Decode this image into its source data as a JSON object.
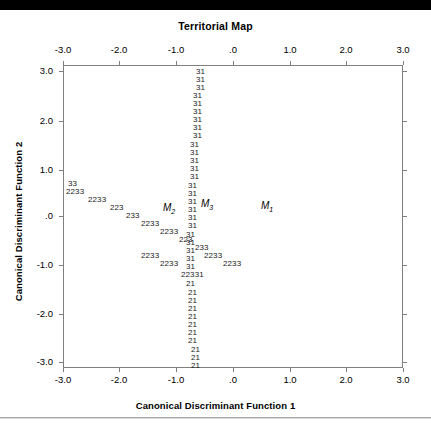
{
  "chart_data": {
    "type": "scatter",
    "title": "Territorial Map",
    "subtitle": "Canonical Discriminant Functions",
    "xlabel": "Canonical Discriminant Function 1",
    "ylabel": "Canonical Discriminant Function 2",
    "xlim": [
      -3.5,
      3.5
    ],
    "ylim": [
      -3.5,
      3.5
    ],
    "xticks": [
      "-3.0",
      "-2.0",
      "-1.0",
      ".0",
      "1.0",
      "2.0",
      "3.0"
    ],
    "xtick_values": [
      -3.0,
      -2.0,
      -1.0,
      0.0,
      1.0,
      2.0,
      3.0
    ],
    "yticks": [
      "3.0",
      "2.0",
      "1.0",
      ".0",
      "-1.0",
      "-2.0",
      "-3.0"
    ],
    "ytick_values": [
      3.0,
      2.0,
      1.0,
      0.0,
      -1.0,
      -2.0,
      -3.0
    ],
    "grid": false,
    "legend": "none",
    "series": [
      {
        "name": "boundary-3-1",
        "symbol": "31",
        "description": "Vertical territorial boundary separating group 3 and group 1",
        "points": [
          {
            "x": -0.6,
            "y": 3.22
          },
          {
            "x": -0.6,
            "y": 3.05
          },
          {
            "x": -0.6,
            "y": 2.88
          },
          {
            "x": -0.63,
            "y": 2.71
          },
          {
            "x": -0.63,
            "y": 2.54
          },
          {
            "x": -0.63,
            "y": 2.37
          },
          {
            "x": -0.63,
            "y": 2.2
          },
          {
            "x": -0.63,
            "y": 2.03
          },
          {
            "x": -0.63,
            "y": 1.86
          },
          {
            "x": -0.66,
            "y": 1.69
          },
          {
            "x": -0.66,
            "y": 1.52
          },
          {
            "x": -0.66,
            "y": 1.35
          },
          {
            "x": -0.66,
            "y": 1.18
          },
          {
            "x": -0.66,
            "y": 1.01
          },
          {
            "x": -0.7,
            "y": 0.84
          },
          {
            "x": -0.7,
            "y": 0.67
          },
          {
            "x": -0.7,
            "y": 0.5
          },
          {
            "x": -0.7,
            "y": 0.33
          },
          {
            "x": -0.7,
            "y": 0.16
          },
          {
            "x": -0.7,
            "y": -0.01
          },
          {
            "x": -0.73,
            "y": -0.18
          },
          {
            "x": -0.73,
            "y": -0.35
          },
          {
            "x": -0.73,
            "y": -0.52
          },
          {
            "x": -0.73,
            "y": -0.69
          },
          {
            "x": -0.73,
            "y": -0.86
          },
          {
            "x": -0.73,
            "y": -1.03
          }
        ]
      },
      {
        "name": "boundary-2-3",
        "symbol": "2233",
        "description": "Diagonal territorial boundary separating group 2 and group 3",
        "points": [
          {
            "x": -3.02,
            "y": 0.5
          },
          {
            "x": -2.94,
            "y": 0.33
          },
          {
            "x": -2.72,
            "y": 0.16
          },
          {
            "x": -2.5,
            "y": -0.01
          },
          {
            "x": -2.34,
            "y": -0.18
          },
          {
            "x": -2.18,
            "y": -0.35
          },
          {
            "x": -1.99,
            "y": -0.52
          },
          {
            "x": -1.8,
            "y": -0.69
          },
          {
            "x": -1.64,
            "y": -0.86
          },
          {
            "x": -1.45,
            "y": -1.03
          },
          {
            "x": -1.26,
            "y": -1.2
          }
        ]
      },
      {
        "name": "boundary-2-1",
        "symbol": "21",
        "description": "Vertical territorial boundary separating group 2 and group 1",
        "points": [
          {
            "x": -0.79,
            "y": -1.45
          },
          {
            "x": -0.79,
            "y": -1.62
          },
          {
            "x": -0.79,
            "y": -1.79
          },
          {
            "x": -0.79,
            "y": -1.96
          },
          {
            "x": -0.79,
            "y": -2.13
          },
          {
            "x": -0.79,
            "y": -2.3
          },
          {
            "x": -0.79,
            "y": -2.47
          },
          {
            "x": -0.79,
            "y": -2.64
          },
          {
            "x": -0.73,
            "y": -2.81
          },
          {
            "x": -0.73,
            "y": -2.98
          },
          {
            "x": -0.73,
            "y": -3.15
          }
        ]
      }
    ],
    "centroids": [
      {
        "label": "M",
        "subscript": "2",
        "group": 2,
        "x": -1.02,
        "y": 0.02
      },
      {
        "label": "M",
        "subscript": "3",
        "group": 3,
        "x": -0.32,
        "y": 0.14
      },
      {
        "label": "M",
        "subscript": "1",
        "group": 1,
        "x": 0.86,
        "y": 0.04
      }
    ],
    "symbol_rows": [
      {
        "text": "31",
        "x": 196,
        "y": 68
      },
      {
        "text": "31",
        "x": 196,
        "y": 76
      },
      {
        "text": "31",
        "x": 196,
        "y": 84
      },
      {
        "text": "31",
        "x": 193,
        "y": 92
      },
      {
        "text": "31",
        "x": 193,
        "y": 100
      },
      {
        "text": "31",
        "x": 193,
        "y": 108
      },
      {
        "text": "31",
        "x": 193,
        "y": 116
      },
      {
        "text": "31",
        "x": 193,
        "y": 124
      },
      {
        "text": "31",
        "x": 193,
        "y": 132
      },
      {
        "text": "31",
        "x": 190,
        "y": 141
      },
      {
        "text": "31",
        "x": 190,
        "y": 149
      },
      {
        "text": "31",
        "x": 190,
        "y": 157
      },
      {
        "text": "31",
        "x": 190,
        "y": 165
      },
      {
        "text": "31",
        "x": 190,
        "y": 173
      },
      {
        "text": "31",
        "x": 188,
        "y": 182
      },
      {
        "text": "31",
        "x": 188,
        "y": 190
      },
      {
        "text": "31",
        "x": 188,
        "y": 198
      },
      {
        "text": "31",
        "x": 188,
        "y": 206
      },
      {
        "text": "31",
        "x": 188,
        "y": 214
      },
      {
        "text": "31",
        "x": 188,
        "y": 222
      },
      {
        "text": "31",
        "x": 186,
        "y": 231
      },
      {
        "text": "31",
        "x": 186,
        "y": 239
      },
      {
        "text": "31",
        "x": 186,
        "y": 247
      },
      {
        "text": "31",
        "x": 186,
        "y": 255
      },
      {
        "text": "31",
        "x": 186,
        "y": 263
      },
      {
        "text": "33",
        "x": 68,
        "y": 180
      },
      {
        "text": "2233",
        "x": 66,
        "y": 188
      },
      {
        "text": "2233",
        "x": 88,
        "y": 196
      },
      {
        "text": "223",
        "x": 110,
        "y": 204
      },
      {
        "text": "233",
        "x": 126,
        "y": 212
      },
      {
        "text": "2233",
        "x": 141,
        "y": 220
      },
      {
        "text": "2233",
        "x": 160,
        "y": 228
      },
      {
        "text": "223",
        "x": 179,
        "y": 236
      },
      {
        "text": "233",
        "x": 195,
        "y": 244
      },
      {
        "text": "2233",
        "x": 204,
        "y": 252
      },
      {
        "text": "2233",
        "x": 223,
        "y": 260
      },
      {
        "text": "22331",
        "x": 181,
        "y": 271
      },
      {
        "text": "21",
        "x": 186,
        "y": 280
      },
      {
        "text": "21",
        "x": 188,
        "y": 289
      },
      {
        "text": "21",
        "x": 188,
        "y": 297
      },
      {
        "text": "21",
        "x": 188,
        "y": 305
      },
      {
        "text": "21",
        "x": 188,
        "y": 313
      },
      {
        "text": "21",
        "x": 188,
        "y": 321
      },
      {
        "text": "21",
        "x": 188,
        "y": 329
      },
      {
        "text": "21",
        "x": 188,
        "y": 337
      },
      {
        "text": "21",
        "x": 191,
        "y": 346
      },
      {
        "text": "21",
        "x": 191,
        "y": 354
      },
      {
        "text": "21",
        "x": 191,
        "y": 362
      }
    ],
    "diagonal_rows": [
      {
        "text": "2233",
        "x": 141,
        "y": 252
      },
      {
        "text": "2233",
        "x": 160,
        "y": 260
      }
    ]
  },
  "chart": {
    "title": "Territorial Map",
    "xaxis_title": "Canonical Discriminant Function 1",
    "yaxis_title": "Canonical Discriminant Function 2",
    "xticks": [
      {
        "label": "-3.0",
        "px": 63
      },
      {
        "label": "-2.0",
        "px": 119
      },
      {
        "label": "-1.0",
        "px": 176
      },
      {
        "label": ".0",
        "px": 233
      },
      {
        "label": "1.0",
        "px": 290
      },
      {
        "label": "2.0",
        "px": 346
      },
      {
        "label": "3.0",
        "px": 403
      }
    ],
    "yticks": [
      {
        "label": "3.0",
        "px": 71
      },
      {
        "label": "2.0",
        "px": 121
      },
      {
        "label": "1.0",
        "px": 170
      },
      {
        "label": ".0",
        "px": 216
      },
      {
        "label": "-1.0",
        "px": 265
      },
      {
        "label": "-2.0",
        "px": 314
      },
      {
        "label": "-3.0",
        "px": 362
      }
    ],
    "centroid_labels": [
      {
        "label": "M",
        "sub": "2",
        "x": 163,
        "y": 203
      },
      {
        "label": "M",
        "sub": "3",
        "x": 201,
        "y": 199
      },
      {
        "label": "M",
        "sub": "1",
        "x": 261,
        "y": 201
      }
    ]
  }
}
